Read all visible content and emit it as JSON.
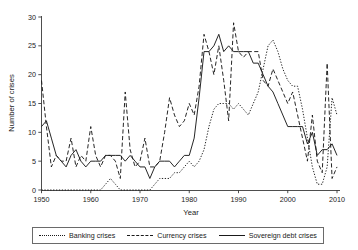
{
  "chart_data": {
    "type": "line",
    "title": "",
    "xlabel": "Year",
    "ylabel": "Number of crises",
    "xlim": [
      1950,
      2010
    ],
    "ylim": [
      0,
      30
    ],
    "xticks": [
      1950,
      1960,
      1970,
      1980,
      1990,
      2000,
      2010
    ],
    "yticks": [
      0,
      5,
      10,
      15,
      20,
      25,
      30
    ],
    "grid": false,
    "legend_position": "below",
    "x": [
      1950,
      1951,
      1952,
      1953,
      1954,
      1955,
      1956,
      1957,
      1958,
      1959,
      1960,
      1961,
      1962,
      1963,
      1964,
      1965,
      1966,
      1967,
      1968,
      1969,
      1970,
      1971,
      1972,
      1973,
      1974,
      1975,
      1976,
      1977,
      1978,
      1979,
      1980,
      1981,
      1982,
      1983,
      1984,
      1985,
      1986,
      1987,
      1988,
      1989,
      1990,
      1991,
      1992,
      1993,
      1994,
      1995,
      1996,
      1997,
      1998,
      1999,
      2000,
      2001,
      2002,
      2003,
      2004,
      2005,
      2006,
      2007,
      2008,
      2009,
      2010
    ],
    "series": [
      {
        "name": "Banking crises",
        "style": "dotted",
        "values": [
          0,
          0,
          0,
          0,
          0,
          0,
          0,
          0,
          0,
          0,
          0,
          0,
          0,
          1,
          2,
          1,
          0,
          0,
          0,
          0,
          0,
          0,
          0,
          1,
          2,
          2,
          2,
          3,
          3,
          4,
          5,
          4,
          5,
          7,
          11,
          14,
          15,
          15,
          15,
          14,
          15,
          14,
          13,
          15,
          17,
          21,
          25,
          26,
          24,
          21,
          19,
          18,
          18,
          14,
          9,
          4,
          1,
          1,
          4,
          16,
          13
        ]
      },
      {
        "name": "Currency crises",
        "style": "dashed",
        "values": [
          19,
          11,
          4,
          6,
          5,
          5,
          9,
          4,
          6,
          5,
          11,
          6,
          4,
          6,
          6,
          5,
          2,
          17,
          7,
          4,
          5,
          9,
          4,
          4,
          5,
          10,
          16,
          13,
          11,
          12,
          15,
          13,
          18,
          27,
          24,
          20,
          25,
          19,
          12,
          29,
          24,
          23,
          24,
          24,
          24,
          19,
          18,
          21,
          19,
          17,
          15,
          17,
          13,
          9,
          5,
          13,
          5,
          3,
          22,
          2,
          4
        ]
      },
      {
        "name": "Sovereign debt crises",
        "style": "solid",
        "values": [
          11,
          12,
          9,
          6,
          5,
          4,
          6,
          7,
          5,
          4,
          5,
          5,
          5,
          6,
          6,
          6,
          6,
          5,
          6,
          5,
          4,
          4,
          2,
          4,
          5,
          5,
          5,
          4,
          5,
          6,
          6,
          9,
          16,
          24,
          24,
          25,
          27,
          24,
          25,
          24,
          24,
          24,
          24,
          22,
          22,
          20,
          18,
          17,
          15,
          13,
          11,
          11,
          11,
          11,
          8,
          10,
          6,
          7,
          7,
          8,
          6
        ]
      }
    ]
  },
  "legend": {
    "items": [
      {
        "label": "Banking crises",
        "style": "dotted"
      },
      {
        "label": "Currency crises",
        "style": "dashed"
      },
      {
        "label": "Sovereign debt crises",
        "style": "solid"
      }
    ]
  },
  "axes": {
    "y_title": "Number of crises",
    "x_title": "Year",
    "y_tick_labels": [
      "0",
      "5",
      "10",
      "15",
      "20",
      "25",
      "30"
    ],
    "x_tick_labels": [
      "1950",
      "1960",
      "1970",
      "1980",
      "1990",
      "2000",
      "2010"
    ]
  },
  "colors": {
    "ink": "#1a1a1a",
    "axis": "#3a3a3a",
    "background": "#ffffff",
    "legend_border": "#6a6a6a"
  }
}
